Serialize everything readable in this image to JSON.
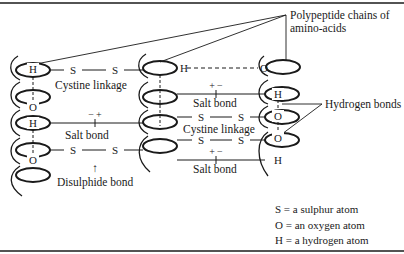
{
  "diagram": {
    "title_label": {
      "line1": "Polypeptide chains of",
      "line2": "amino-acids"
    },
    "bond_labels": {
      "cystine_linkage_top": "Cystine  linkage",
      "cystine_linkage_mid": "Cystine linkage",
      "salt_bond_left": "Salt bond",
      "salt_bond_mid_top": "Salt bond",
      "salt_bond_mid_bottom": "Salt bond",
      "disulphide_bond": "Disulphide bond",
      "hydrogen_bonds": "Hydrogen bonds"
    },
    "charges": {
      "left_salt": "− +",
      "mid_salt_top": "+ −",
      "mid_salt_bottom": "+ −"
    },
    "atoms": {
      "S": "S",
      "O": "O",
      "H": "H"
    },
    "arrow_glyph": "↑",
    "legend": [
      {
        "symbol": "S",
        "text": "S = a sulphur atom"
      },
      {
        "symbol": "O",
        "text": "O = an oxygen atom"
      },
      {
        "symbol": "H",
        "text": "H = a hydrogen atom"
      }
    ],
    "colors": {
      "ink": "#1a1a1a",
      "background": "#ffffff"
    }
  }
}
